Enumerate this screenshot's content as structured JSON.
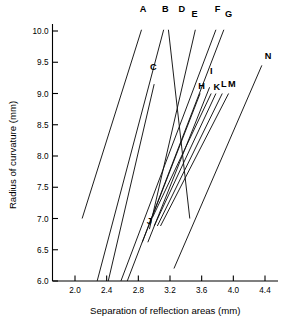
{
  "chart_data": {
    "type": "line",
    "title": "",
    "xlabel": "Separation of reflection areas (mm)",
    "ylabel": "Radius of curvature (mm)",
    "xlim": [
      1.75,
      4.62
    ],
    "ylim": [
      6.0,
      10.25
    ],
    "xticks": [
      "2.0",
      "2.4",
      "2.8",
      "3.2",
      "3.6",
      "4.0",
      "4.4"
    ],
    "xtick_values": [
      2.0,
      2.4,
      2.8,
      3.2,
      3.6,
      4.0,
      4.4
    ],
    "yticks": [
      "6.0",
      "6.5",
      "7.0",
      "7.5",
      "8.0",
      "8.5",
      "9.0",
      "9.5",
      "10.0"
    ],
    "ytick_values": [
      6.0,
      6.5,
      7.0,
      7.5,
      8.0,
      8.5,
      9.0,
      9.5,
      10.0
    ],
    "grid": false,
    "legend_position": "inline-endpoint-labels",
    "line_color": "#111111",
    "axis_color": "#000000",
    "series": [
      {
        "name": "A",
        "x": [
          2.09,
          2.84
        ],
        "y": [
          7.0,
          10.02
        ],
        "label_x": 2.86,
        "label_y": 10.3
      },
      {
        "name": "B",
        "x": [
          2.28,
          3.12
        ],
        "y": [
          6.0,
          10.02
        ],
        "label_x": 3.14,
        "label_y": 10.3
      },
      {
        "name": "C",
        "x": [
          2.42,
          3.0
        ],
        "y": [
          6.0,
          9.15
        ],
        "label_x": 2.99,
        "label_y": 9.38
      },
      {
        "name": "D",
        "x": [
          3.18,
          3.45
        ],
        "y": [
          10.02,
          7.0
        ],
        "label_x": 3.35,
        "label_y": 10.3
      },
      {
        "name": "E",
        "x": [
          2.94,
          3.52
        ],
        "y": [
          6.83,
          10.02
        ],
        "label_x": 3.51,
        "label_y": 10.22
      },
      {
        "name": "F",
        "x": [
          2.58,
          3.78
        ],
        "y": [
          6.0,
          10.02
        ],
        "label_x": 3.8,
        "label_y": 10.3
      },
      {
        "name": "G",
        "x": [
          2.66,
          3.88
        ],
        "y": [
          6.0,
          10.02
        ],
        "label_x": 3.94,
        "label_y": 10.22
      },
      {
        "name": "H",
        "x": [
          2.85,
          3.58
        ],
        "y": [
          6.62,
          9.0
        ],
        "label_x": 3.6,
        "label_y": 9.08
      },
      {
        "name": "I",
        "x": [
          2.92,
          3.7
        ],
        "y": [
          6.62,
          9.1
        ],
        "label_x": 3.72,
        "label_y": 9.32
      },
      {
        "name": "J",
        "x": [
          2.98,
          3.72
        ],
        "y": [
          7.02,
          9.0
        ],
        "label_x": 2.94,
        "label_y": 6.92
      },
      {
        "name": "K",
        "x": [
          3.0,
          3.78
        ],
        "y": [
          6.88,
          9.0
        ],
        "label_x": 3.79,
        "label_y": 9.05
      },
      {
        "name": "L",
        "x": [
          3.04,
          3.86
        ],
        "y": [
          6.88,
          9.0
        ],
        "label_x": 3.88,
        "label_y": 9.1
      },
      {
        "name": "M",
        "x": [
          3.08,
          3.94
        ],
        "y": [
          6.88,
          9.0
        ],
        "label_x": 3.98,
        "label_y": 9.1
      },
      {
        "name": "N",
        "x": [
          3.25,
          4.36
        ],
        "y": [
          6.2,
          9.45
        ],
        "label_x": 4.44,
        "label_y": 9.55
      }
    ]
  },
  "axes": {
    "x_title": "Separation of reflection areas (mm)",
    "y_title": "Radius of curvature (mm)"
  }
}
